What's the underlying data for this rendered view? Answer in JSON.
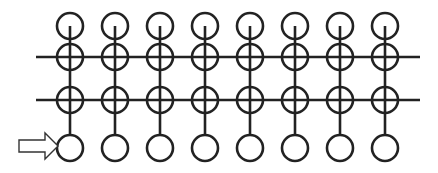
{
  "diagram": {
    "type": "grid-network",
    "columns": 8,
    "column_x": [
      70,
      115,
      160,
      205,
      250,
      295,
      340,
      385
    ],
    "rows": {
      "top_node_y": 26,
      "crossed_row_1_y": 57,
      "crossed_row_2_y": 100,
      "bottom_node_y": 148
    },
    "node_radius": 13,
    "horizontal_lines": [
      {
        "y": 57,
        "x1": 36,
        "x2": 420
      },
      {
        "y": 100,
        "x1": 36,
        "x2": 420
      }
    ],
    "input_arrow": {
      "x1": 19,
      "x2": 58,
      "y": 146,
      "style": "hollow"
    },
    "stroke_color": "#222222",
    "stroke_width": 2.6,
    "background": "#ffffff"
  }
}
